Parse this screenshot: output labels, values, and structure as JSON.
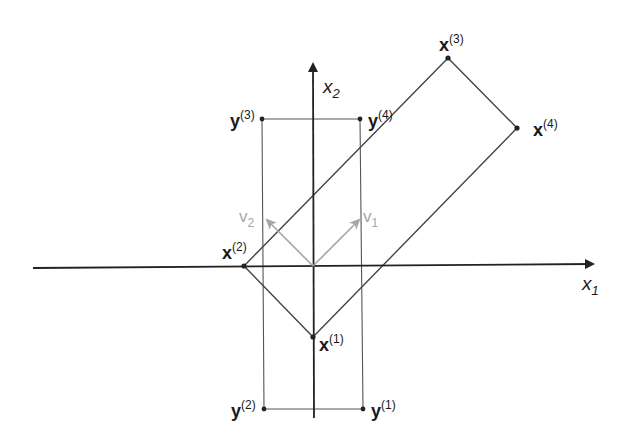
{
  "figure": {
    "axes": {
      "x_label": "x",
      "x_sub": "1",
      "y_label": "x",
      "y_sub": "2"
    },
    "vectors": [
      {
        "name": "v",
        "sub": "1",
        "color": "#a6a6a6"
      },
      {
        "name": "v",
        "sub": "2",
        "color": "#a6a6a6"
      }
    ],
    "x_points": [
      {
        "name": "x",
        "sup": "(1)"
      },
      {
        "name": "x",
        "sup": "(2)"
      },
      {
        "name": "x",
        "sup": "(3)"
      },
      {
        "name": "x",
        "sup": "(4)"
      }
    ],
    "y_points": [
      {
        "name": "y",
        "sup": "(1)"
      },
      {
        "name": "y",
        "sup": "(2)"
      },
      {
        "name": "y",
        "sup": "(3)"
      },
      {
        "name": "y",
        "sup": "(4)"
      }
    ],
    "colors": {
      "line": "#4a4a4a",
      "axis": "#222222",
      "vector": "#a6a6a6",
      "background": "#ffffff"
    }
  }
}
